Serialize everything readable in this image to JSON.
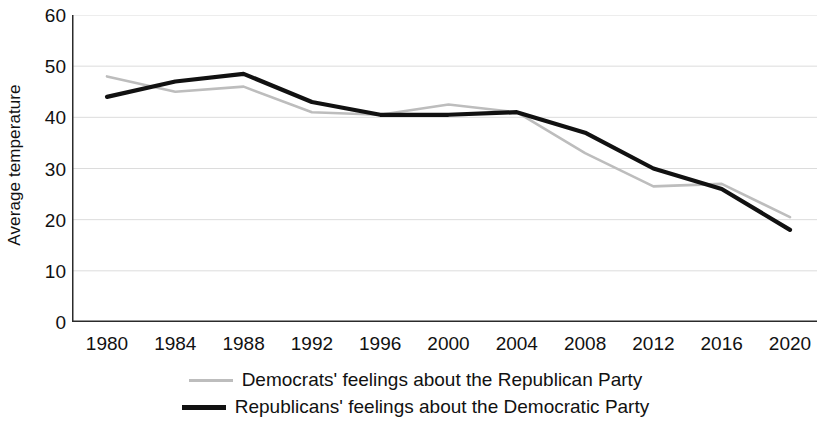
{
  "chart_data": {
    "type": "line",
    "title": "",
    "xlabel": "",
    "ylabel": "Average temperature",
    "categories": [
      1980,
      1984,
      1988,
      1992,
      1996,
      2000,
      2004,
      2008,
      2012,
      2016,
      2020
    ],
    "xticklabels": [
      "1980",
      "1984",
      "1988",
      "1992",
      "1996",
      "2000",
      "2004",
      "2008",
      "2012",
      "2016",
      "2020"
    ],
    "yticklabels": [
      "0",
      "10",
      "20",
      "30",
      "40",
      "50",
      "60"
    ],
    "yticks": [
      0,
      10,
      20,
      30,
      40,
      50,
      60
    ],
    "ylim": [
      0,
      60
    ],
    "xlim": [
      1980,
      2020
    ],
    "grid": "horizontal",
    "legend_position": "bottom-center",
    "series": [
      {
        "name": "Democrats' feelings about the Republican Party",
        "color": "#bdbdbd",
        "values": [
          48,
          45,
          46,
          41,
          40.5,
          42.5,
          41,
          33,
          26.5,
          27,
          20.5
        ]
      },
      {
        "name": "Republicans' feelings about the Democratic Party",
        "color": "#111111",
        "values": [
          44,
          47,
          48.5,
          43,
          40.5,
          40.5,
          41,
          37,
          30,
          26,
          18
        ]
      }
    ]
  },
  "axis": {
    "y_title": "Average temperature"
  },
  "legend": {
    "items": [
      {
        "label": "Democrats' feelings about the Republican Party"
      },
      {
        "label": "Republicans' feelings about the Democratic Party"
      }
    ]
  }
}
